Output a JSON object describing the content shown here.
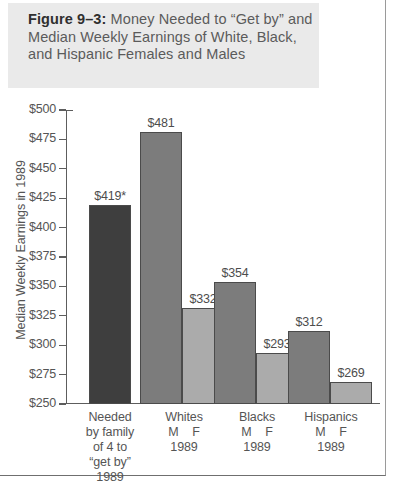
{
  "caption": {
    "label": "Figure 9–3:",
    "body": "Money Needed to “Get by” and Median Weekly Earnings of White, Black, and Hispanic Females and Males"
  },
  "chart_data": {
    "type": "bar",
    "title": "Money Needed to “Get by” and Median Weekly Earnings of White, Black, and Hispanic Females and Males",
    "xlabel": "",
    "ylabel": "Median Weekly Earnings in 1989",
    "ylim": [
      250,
      500
    ],
    "ytick_step": 25,
    "grid": false,
    "legend": "none",
    "ytick_labels": [
      "$500",
      "$475",
      "$450",
      "$425",
      "$400",
      "$375",
      "$350",
      "$325",
      "$300",
      "$275",
      "$250"
    ],
    "ytick_values": [
      500,
      475,
      450,
      425,
      400,
      375,
      350,
      325,
      300,
      275,
      250
    ],
    "categories": [
      "Needed by family of 4 to “get by” 1989",
      "Whites M F 1989",
      "Blacks M F 1989",
      "Hispanics M F 1989"
    ],
    "groups": [
      {
        "name": "needed-to-get-by",
        "label_lines": [
          "Needed",
          "by family",
          "of 4 to",
          "“get by”",
          "1989"
        ],
        "bars": [
          {
            "series": "needed",
            "value": 419,
            "label": "$419*",
            "color": "#3e3e3e"
          }
        ]
      },
      {
        "name": "whites",
        "label_lines": [
          "Whites",
          "M    F",
          "1989"
        ],
        "bars": [
          {
            "series": "male",
            "value": 481,
            "label": "$481",
            "color": "#7c7c7c"
          },
          {
            "series": "female",
            "value": 332,
            "label": "$332",
            "color": "#ababab"
          }
        ]
      },
      {
        "name": "blacks",
        "label_lines": [
          "Blacks",
          "M    F",
          "1989"
        ],
        "bars": [
          {
            "series": "male",
            "value": 354,
            "label": "$354",
            "color": "#7c7c7c"
          },
          {
            "series": "female",
            "value": 293,
            "label": "$293",
            "color": "#ababab"
          }
        ]
      },
      {
        "name": "hispanics",
        "label_lines": [
          "Hispanics",
          "M    F",
          "1989"
        ],
        "bars": [
          {
            "series": "male",
            "value": 312,
            "label": "$312",
            "color": "#7c7c7c"
          },
          {
            "series": "female",
            "value": 269,
            "label": "$269",
            "color": "#ababab"
          }
        ]
      }
    ],
    "series": [
      {
        "name": "Needed to get by",
        "values": [
          419,
          null,
          null,
          null
        ]
      },
      {
        "name": "Male",
        "values": [
          null,
          481,
          354,
          312
        ]
      },
      {
        "name": "Female",
        "values": [
          null,
          332,
          293,
          269
        ]
      }
    ],
    "annotations": [
      "* asterisk on $419 value"
    ]
  }
}
